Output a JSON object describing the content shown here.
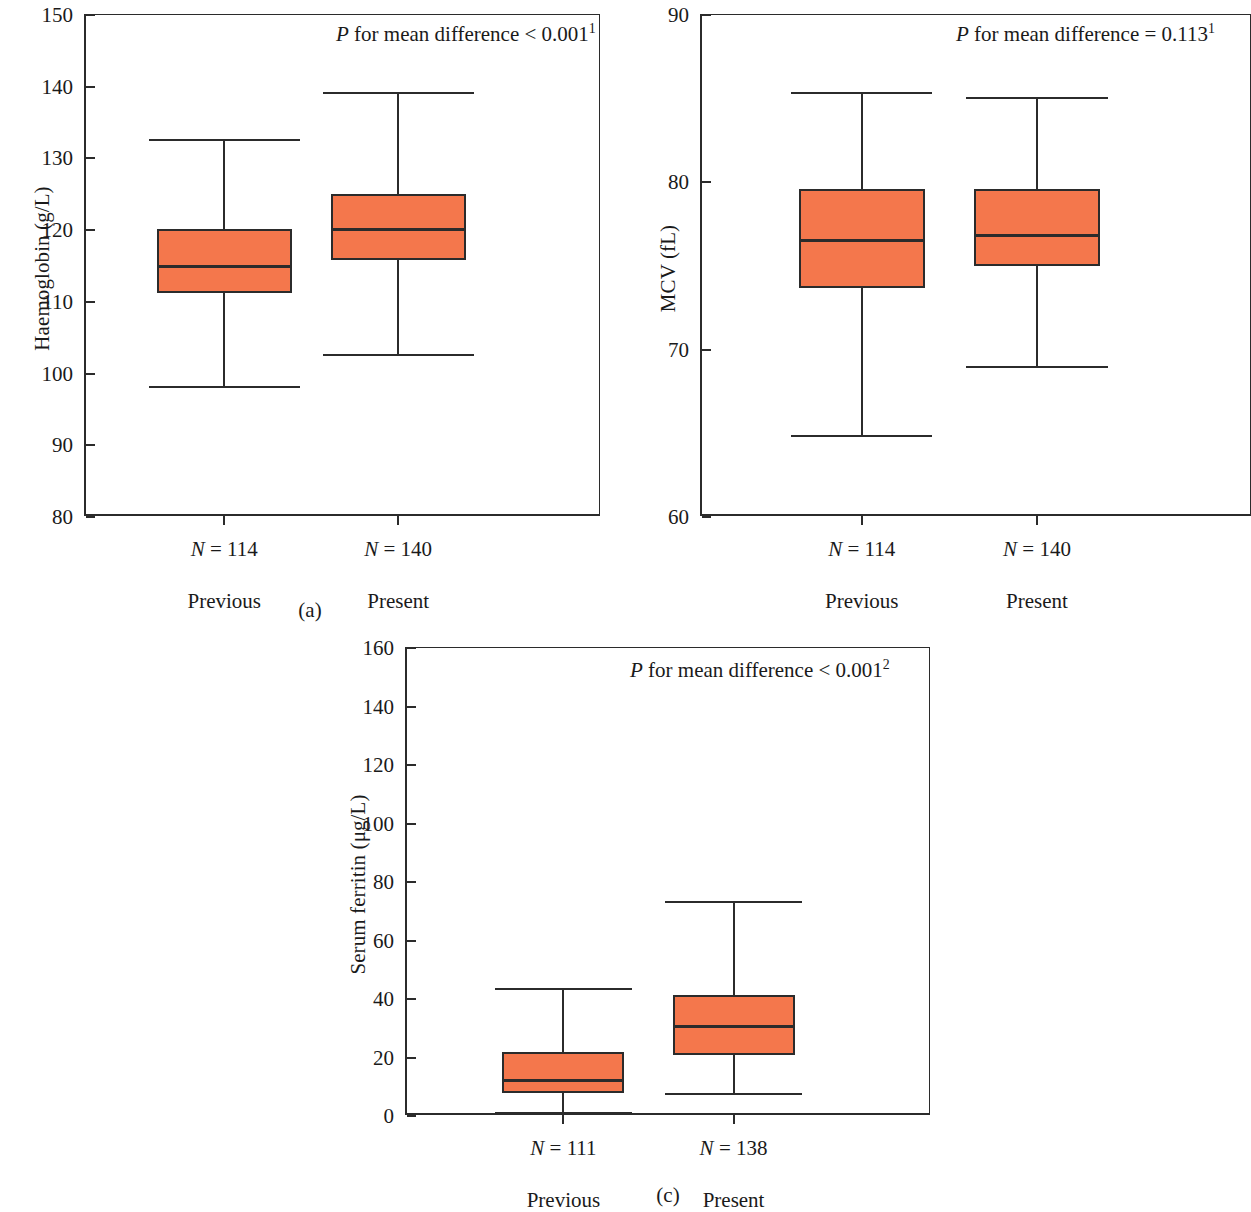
{
  "figure": {
    "panels": [
      {
        "caption": "(a)",
        "annotation_prefix": "P",
        "annotation_text": " for mean difference < 0.001",
        "annotation_sup": "1"
      },
      {
        "caption": "(b)",
        "annotation_prefix": "P",
        "annotation_text": " for mean difference = 0.113",
        "annotation_sup": "1"
      },
      {
        "caption": "(c)",
        "annotation_prefix": "P",
        "annotation_text": " for mean difference < 0.001",
        "annotation_sup": "2"
      }
    ],
    "colors": {
      "box_fill": "#F4774C",
      "line": "#2b2b2b",
      "background": "#ffffff"
    }
  },
  "chart_data": [
    {
      "type": "box",
      "panel": "a",
      "title": "",
      "ylabel": "Haemoglobin (g/L)",
      "xlabel": "",
      "ylim": [
        80,
        150
      ],
      "yticks": [
        80,
        90,
        100,
        110,
        120,
        130,
        140,
        150
      ],
      "ytick_labels": [
        "80",
        "90",
        "100",
        "110",
        "120",
        "130",
        "140",
        "150"
      ],
      "grid": false,
      "annotation": "P for mean difference < 0.001",
      "annotation_superscript": "1",
      "categories": [
        "Previous",
        "Present"
      ],
      "n_labels": [
        "N = 114",
        "N = 140"
      ],
      "boxes": [
        {
          "name": "Previous",
          "n": 114,
          "whisker_low": 98.2,
          "q1": 111.2,
          "median": 115.2,
          "q3": 120.2,
          "whisker_high": 132.7
        },
        {
          "name": "Present",
          "n": 140,
          "whisker_low": 102.7,
          "q1": 115.8,
          "median": 120.3,
          "q3": 125.0,
          "whisker_high": 139.2
        }
      ]
    },
    {
      "type": "box",
      "panel": "b",
      "title": "",
      "ylabel": "MCV (fL)",
      "xlabel": "",
      "ylim": [
        60,
        90
      ],
      "yticks": [
        60,
        70,
        80,
        90
      ],
      "ytick_labels": [
        "60",
        "70",
        "80",
        "90"
      ],
      "grid": false,
      "annotation": "P for mean difference = 0.113",
      "annotation_superscript": "1",
      "categories": [
        "Previous",
        "Present"
      ],
      "n_labels": [
        "N = 114",
        "N = 140"
      ],
      "boxes": [
        {
          "name": "Previous",
          "n": 114,
          "whisker_low": 64.9,
          "q1": 73.7,
          "median": 76.6,
          "q3": 79.6,
          "whisker_high": 85.4
        },
        {
          "name": "Present",
          "n": 140,
          "whisker_low": 69.0,
          "q1": 75.0,
          "median": 76.9,
          "q3": 79.6,
          "whisker_high": 85.1
        }
      ]
    },
    {
      "type": "box",
      "panel": "c",
      "title": "",
      "ylabel": "Serum ferritin (μg/L)",
      "xlabel": "",
      "ylim": [
        0,
        160
      ],
      "yticks": [
        0,
        20,
        40,
        60,
        80,
        100,
        120,
        140,
        160
      ],
      "ytick_labels": [
        "0",
        "20",
        "40",
        "60",
        "80",
        "100",
        "120",
        "140",
        "160"
      ],
      "grid": false,
      "annotation": "P for mean difference < 0.001",
      "annotation_superscript": "2",
      "categories": [
        "Previous",
        "Present"
      ],
      "n_labels": [
        "N = 111",
        "N = 138"
      ],
      "boxes": [
        {
          "name": "Previous",
          "n": 111,
          "whisker_low": 1.5,
          "q1": 8.0,
          "median": 12.5,
          "q3": 22.0,
          "whisker_high": 43.8
        },
        {
          "name": "Present",
          "n": 138,
          "whisker_low": 8.0,
          "q1": 20.7,
          "median": 31.2,
          "q3": 41.5,
          "whisker_high": 73.5
        }
      ]
    }
  ]
}
